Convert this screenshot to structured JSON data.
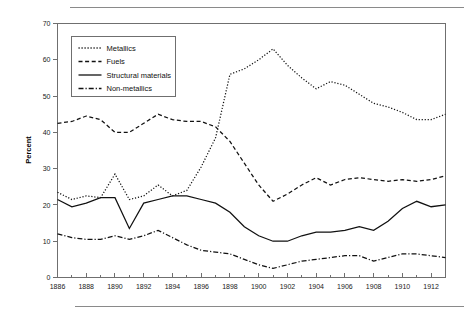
{
  "chart_data": {
    "type": "line",
    "title": "",
    "xlabel": "",
    "ylabel": "Percent",
    "xlim": [
      1886,
      1913
    ],
    "ylim": [
      0,
      70
    ],
    "ytick_step": 10,
    "yticks": [
      0,
      10,
      20,
      30,
      40,
      50,
      60,
      70
    ],
    "xticks_major": [
      1886,
      1888,
      1890,
      1892,
      1894,
      1896,
      1898,
      1900,
      1902,
      1904,
      1906,
      1908,
      1910,
      1912
    ],
    "xticks_minor": [
      1887,
      1889,
      1891,
      1893,
      1895,
      1897,
      1899,
      1901,
      1903,
      1905,
      1907,
      1909,
      1911,
      1913
    ],
    "grid": false,
    "legend_position": "upper-left",
    "x": [
      1886,
      1887,
      1888,
      1889,
      1890,
      1891,
      1892,
      1893,
      1894,
      1895,
      1896,
      1897,
      1898,
      1899,
      1900,
      1901,
      1902,
      1903,
      1904,
      1905,
      1906,
      1907,
      1908,
      1909,
      1910,
      1911,
      1912,
      1913
    ],
    "series": [
      {
        "name": "Metallics",
        "style": "dotted",
        "dash": "1.2 1.8",
        "values": [
          23.5,
          21.5,
          22.5,
          22.0,
          28.5,
          21.5,
          22.5,
          25.5,
          22.5,
          24.0,
          30.5,
          38.5,
          56.0,
          57.5,
          60.0,
          63.0,
          58.5,
          55.0,
          52.0,
          54.0,
          53.0,
          50.5,
          48.0,
          47.0,
          45.5,
          43.5,
          43.5,
          45.0
        ]
      },
      {
        "name": "Fuels",
        "style": "dashed",
        "dash": "4 2.6",
        "values": [
          42.5,
          43.0,
          44.5,
          43.5,
          40.0,
          40.0,
          42.5,
          45.0,
          43.5,
          43.0,
          43.0,
          41.5,
          37.5,
          31.5,
          25.5,
          21.0,
          23.0,
          25.5,
          27.5,
          25.5,
          27.0,
          27.5,
          27.0,
          26.5,
          27.0,
          26.5,
          27.0,
          28.0
        ]
      },
      {
        "name": "Structural materials",
        "style": "solid",
        "dash": "",
        "values": [
          21.5,
          19.5,
          20.5,
          22.0,
          22.0,
          13.5,
          20.5,
          21.5,
          22.5,
          22.5,
          21.5,
          20.5,
          18.0,
          14.0,
          11.5,
          10.0,
          10.0,
          11.5,
          12.5,
          12.5,
          13.0,
          14.0,
          13.0,
          15.5,
          19.0,
          21.0,
          19.5,
          20.0
        ]
      },
      {
        "name": "Non-metallics",
        "style": "dashdot",
        "dash": "5 2 1.2 2",
        "values": [
          12.0,
          11.0,
          10.5,
          10.5,
          11.5,
          10.5,
          11.5,
          13.0,
          11.0,
          9.0,
          7.5,
          7.0,
          6.5,
          5.0,
          3.5,
          2.5,
          3.5,
          4.5,
          5.0,
          5.5,
          6.0,
          6.0,
          4.5,
          5.5,
          6.5,
          6.5,
          6.0,
          5.5
        ]
      }
    ],
    "legend_entries": [
      "Metallics",
      "Fuels",
      "Structural materials",
      "Non-metallics"
    ],
    "colors": {
      "line": "#111111",
      "axis": "#6f6f6f",
      "text": "#1a1a1a",
      "rule": "#8a8a8a",
      "background": "#ffffff"
    }
  }
}
